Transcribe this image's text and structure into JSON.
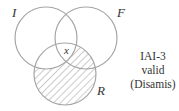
{
  "diagram": {
    "type": "venn-3",
    "circles": [
      {
        "id": "I",
        "label": "I",
        "cx": 46,
        "cy": 38,
        "r": 31
      },
      {
        "id": "F",
        "label": "F",
        "cx": 86,
        "cy": 38,
        "r": 31
      },
      {
        "id": "R",
        "label": "R",
        "cx": 65,
        "cy": 74,
        "r": 31
      }
    ],
    "shaded_region": "R minus I∪F... plus R∩F outside I (R excluding I)",
    "marker": {
      "symbol": "x",
      "region": "I ∩ F ∩ R"
    },
    "stroke_color": "#a6a6a6",
    "hatch_color": "#9a9a9a"
  },
  "caption": {
    "line1": "IAI-3",
    "line2": "valid",
    "line3": "(Disamis)"
  }
}
